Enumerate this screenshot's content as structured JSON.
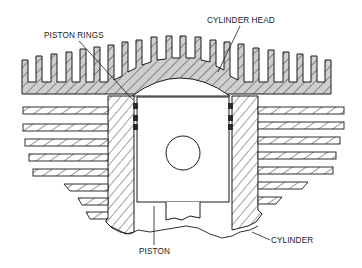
{
  "figure": {
    "labels": {
      "piston_rings": "PISTON RINGS",
      "cylinder_head": "CYLINDER HEAD",
      "piston": "PISTON",
      "cylinder": "CYLINDER"
    },
    "colors": {
      "line": "#1a1a1a",
      "head_fill": "#cfcfcf",
      "background": "#ffffff"
    }
  }
}
